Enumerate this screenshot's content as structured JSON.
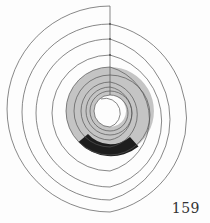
{
  "page": {
    "page_number": "159"
  },
  "figure": {
    "colors": {
      "line": "#555555",
      "band_fill": "#c4c4c4",
      "sector_fill": "#1e1e1e"
    }
  }
}
